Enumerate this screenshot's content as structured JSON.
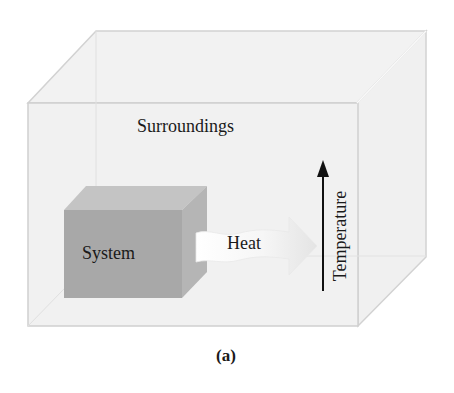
{
  "figure": {
    "caption": "(a)",
    "surroundings_label": "Surroundings",
    "system_label": "System",
    "heat_label": "Heat",
    "temperature_label": "Temperature"
  },
  "colors": {
    "surroundings_fill": "#f0f0f0",
    "surroundings_edge": "#cfcfcf",
    "system_front": "#a9a9a9",
    "system_top": "#c3c3c3",
    "system_side": "#b6b6b6",
    "heat_arrow": "#f7f7f7",
    "temperature_arrow": "#111111",
    "text": "#1a1a1a"
  }
}
